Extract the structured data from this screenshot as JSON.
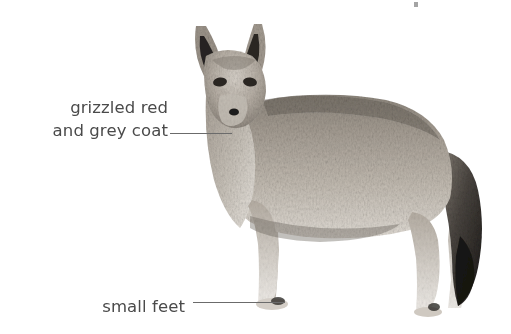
{
  "figure": {
    "width": 511,
    "height": 334,
    "background_color": "#ffffff",
    "text_color": "#4a4a4a",
    "leader_line_color": "#6b6b6b"
  },
  "callouts": [
    {
      "id": "coat",
      "label": "grizzled red\nand grey coat",
      "line1": "grizzled red",
      "line2": "and grey coat",
      "points_to": "shoulder"
    },
    {
      "id": "feet",
      "label": "small feet",
      "line1": "small feet",
      "points_to": "front-paw"
    }
  ],
  "animal": {
    "coat_base_color": "#b9b2a8",
    "coat_shadow_color": "#6f6a63",
    "coat_dark_color": "#3a3733",
    "coat_light_color": "#ece8e2",
    "tail_tip_color": "#1e1c1a",
    "ear_inner_color": "#2a2724"
  }
}
